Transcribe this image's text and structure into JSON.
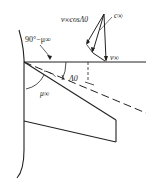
{
  "diagram": {
    "type": "swept-wing Mach cone geometry",
    "labels": {
      "angle_complement": "90°−μ∞",
      "mach_angle": "μ∞",
      "sweep_angle": "Λ0",
      "normal_component": "v∞cosΛ0",
      "freestream_velocity": "v∞",
      "speed_of_sound": "c∞"
    },
    "colors": {
      "line": "#222222",
      "background": "#ffffff"
    }
  }
}
